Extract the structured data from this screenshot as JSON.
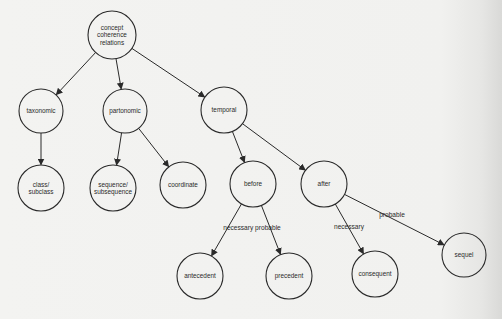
{
  "diagram": {
    "colors": {
      "background": "#f1f1ef",
      "ink": "#2a2a2a"
    },
    "nodes": [
      {
        "id": "root",
        "lines": [
          "concept",
          "coherence",
          "relations"
        ],
        "x": 112,
        "y": 35,
        "r": 24
      },
      {
        "id": "taxonomic",
        "lines": [
          "taxonomic"
        ],
        "x": 41,
        "y": 111,
        "r": 22
      },
      {
        "id": "partonomic",
        "lines": [
          "partonomic"
        ],
        "x": 125,
        "y": 111,
        "r": 22
      },
      {
        "id": "temporal",
        "lines": [
          "temporal"
        ],
        "x": 224,
        "y": 110,
        "r": 23
      },
      {
        "id": "class-subclass",
        "lines": [
          "class/",
          "subclass"
        ],
        "x": 41,
        "y": 188,
        "r": 23
      },
      {
        "id": "sequence-subsequence",
        "lines": [
          "sequence/",
          "subsequence"
        ],
        "x": 113,
        "y": 188,
        "r": 23
      },
      {
        "id": "coordinate",
        "lines": [
          "coordinate"
        ],
        "x": 183,
        "y": 185,
        "r": 23
      },
      {
        "id": "before",
        "lines": [
          "before"
        ],
        "x": 253,
        "y": 184,
        "r": 23
      },
      {
        "id": "after",
        "lines": [
          "after"
        ],
        "x": 324,
        "y": 184,
        "r": 23
      },
      {
        "id": "antecedent",
        "lines": [
          "antecedent"
        ],
        "x": 200,
        "y": 276,
        "r": 23
      },
      {
        "id": "precedent",
        "lines": [
          "precedent"
        ],
        "x": 289,
        "y": 276,
        "r": 23
      },
      {
        "id": "consequent",
        "lines": [
          "consequent"
        ],
        "x": 375,
        "y": 274,
        "r": 23
      },
      {
        "id": "sequel",
        "lines": [
          "sequel"
        ],
        "x": 464,
        "y": 255,
        "r": 22
      }
    ],
    "edges": [
      {
        "from": "root",
        "to": "taxonomic",
        "label": ""
      },
      {
        "from": "root",
        "to": "partonomic",
        "label": ""
      },
      {
        "from": "root",
        "to": "temporal",
        "label": ""
      },
      {
        "from": "taxonomic",
        "to": "class-subclass",
        "label": ""
      },
      {
        "from": "partonomic",
        "to": "sequence-subsequence",
        "label": ""
      },
      {
        "from": "partonomic",
        "to": "coordinate",
        "label": ""
      },
      {
        "from": "temporal",
        "to": "before",
        "label": ""
      },
      {
        "from": "temporal",
        "to": "after",
        "label": ""
      },
      {
        "from": "before",
        "to": "antecedent",
        "label": "necessary"
      },
      {
        "from": "before",
        "to": "precedent",
        "label": "probable"
      },
      {
        "from": "after",
        "to": "consequent",
        "label": "necessary"
      },
      {
        "from": "after",
        "to": "sequel",
        "label": "probable"
      }
    ],
    "edge_labels": [
      {
        "text": "necessary probable",
        "x": 252,
        "y": 230
      },
      {
        "text": "necessary",
        "x": 349,
        "y": 229
      },
      {
        "text": "probable",
        "x": 392,
        "y": 217
      }
    ]
  }
}
